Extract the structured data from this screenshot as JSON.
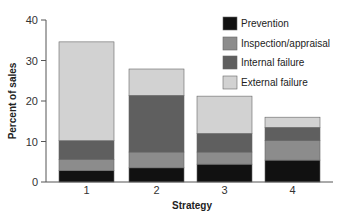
{
  "chart_data": {
    "type": "bar",
    "stacked": true,
    "title": "",
    "xlabel": "Strategy",
    "ylabel": "Percent of sales",
    "ylim": [
      0,
      40
    ],
    "yticks": [
      0,
      10,
      20,
      30,
      40
    ],
    "categories": [
      "1",
      "2",
      "3",
      "4"
    ],
    "grid": false,
    "legend_position": "upper right",
    "series": [
      {
        "name": "Prevention",
        "color": "#111111",
        "values": [
          2.8,
          3.5,
          4.4,
          5.4
        ]
      },
      {
        "name": "Inspection/appraisal",
        "color": "#8c8c8c",
        "values": [
          2.8,
          3.9,
          3.0,
          4.8
        ]
      },
      {
        "name": "Internal failure",
        "color": "#5f5f5f",
        "values": [
          4.6,
          14.0,
          4.6,
          3.3
        ]
      },
      {
        "name": "External failure",
        "color": "#d2d2d2",
        "values": [
          24.4,
          6.5,
          9.2,
          2.5
        ]
      }
    ],
    "totals": [
      34.6,
      27.9,
      21.2,
      16.0
    ]
  }
}
